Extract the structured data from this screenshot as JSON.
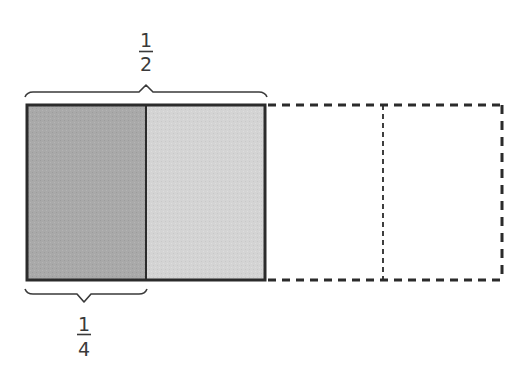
{
  "whole": {
    "parts": 4,
    "outline_style_unshaded": "dashed"
  },
  "segments": [
    {
      "index": 1,
      "state": "shaded-dark",
      "color": "#a8a8a8"
    },
    {
      "index": 2,
      "state": "shaded-light",
      "color": "#d3d3d3"
    },
    {
      "index": 3,
      "state": "empty-dashed",
      "color": "#ffffff"
    },
    {
      "index": 4,
      "state": "empty-dashed",
      "color": "#ffffff"
    }
  ],
  "labels": {
    "top": {
      "numerator": "1",
      "denominator": "2",
      "spans_segments": [
        1,
        2
      ]
    },
    "bottom": {
      "numerator": "1",
      "denominator": "4",
      "spans_segments": [
        1
      ]
    }
  },
  "colors": {
    "stroke": "#2b2b2b",
    "dark_fill": "#a8a8a8",
    "light_fill": "#d3d3d3",
    "text": "#3a3a3a"
  }
}
